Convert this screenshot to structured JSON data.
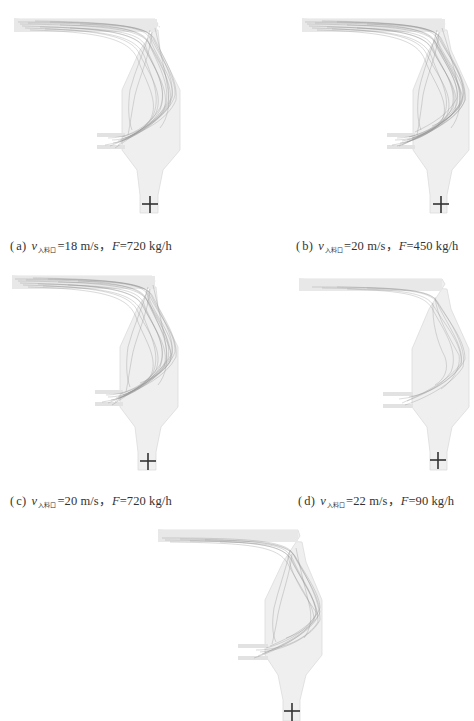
{
  "figure": {
    "panels": [
      {
        "id": "a",
        "label": "a",
        "velocity_symbol": "v",
        "velocity_subscript": "入料口",
        "velocity_value": "=18 m/s，",
        "feed_symbol": "F",
        "feed_value": "=720 kg/h",
        "trajectory_density": "medium"
      },
      {
        "id": "b",
        "label": "b",
        "velocity_symbol": "v",
        "velocity_subscript": "入料口",
        "velocity_value": "=20 m/s，",
        "feed_symbol": "F",
        "feed_value": "=450 kg/h",
        "trajectory_density": "high"
      },
      {
        "id": "c",
        "label": "c",
        "velocity_symbol": "v",
        "velocity_subscript": "入料口",
        "velocity_value": "=20 m/s，",
        "feed_symbol": "F",
        "feed_value": "=720 kg/h",
        "trajectory_density": "high"
      },
      {
        "id": "d",
        "label": "d",
        "velocity_symbol": "v",
        "velocity_subscript": "入料口",
        "velocity_value": "=22 m/s，",
        "feed_symbol": "F",
        "feed_value": "=90 kg/h",
        "trajectory_density": "low"
      },
      {
        "id": "e",
        "label": "e",
        "trajectory_density": "medium"
      }
    ],
    "colors": {
      "background": "#ffffff",
      "vessel_fill": "#efefef",
      "vessel_edge": "#d8d8d8",
      "trajectory": "#7a7a7a",
      "cross_marker": "#333333",
      "caption_text": "#333333"
    }
  }
}
